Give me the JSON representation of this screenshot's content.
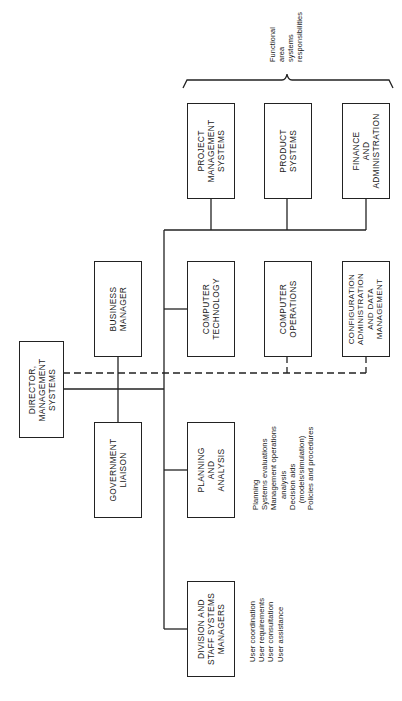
{
  "diagram": {
    "orientation": "rotated -90deg",
    "functional_label": "Functional\narea\nsystems\nresponsibilities",
    "nodes": [
      {
        "id": "director",
        "label": "DIRECTOR,\nMANAGEMENT\nSYSTEMS"
      },
      {
        "id": "business_manager",
        "label": "BUSINESS\nMANAGER"
      },
      {
        "id": "government_liaison",
        "label": "GOVERNMENT\nLIAISON"
      },
      {
        "id": "project_management_systems",
        "label": "PROJECT\nMANAGEMENT\nSYSTEMS"
      },
      {
        "id": "product_systems",
        "label": "PRODUCT\nSYSTEMS"
      },
      {
        "id": "finance_administration",
        "label": "FINANCE\nAND\nADMINISTRATION"
      },
      {
        "id": "computer_technology",
        "label": "COMPUTER\nTECHNOLOGY"
      },
      {
        "id": "computer_operations",
        "label": "COMPUTER\nOPERATIONS"
      },
      {
        "id": "configuration_admin",
        "label": "CONFIGURATION\nADMINISTRATION\nAND DATA\nMANAGEMENT"
      },
      {
        "id": "planning_analysis",
        "label": "PLANNING\nAND\nANALYSIS"
      },
      {
        "id": "division_staff",
        "label": "DIVISION AND\nSTAFF SYSTEMS\nMANAGERS"
      }
    ],
    "notes": {
      "planning_analysis": "Planning\nSystems evaluations\nManagement operations\n     analysis\nDecision aids\n   (models/simulation)\nPolicies and procedures",
      "division_staff": "User coordination\nUser requirements\nUser consultation\nUser assistance"
    },
    "edges": [
      {
        "from": "director",
        "to": "trunk",
        "style": "solid"
      },
      {
        "from": "business_manager",
        "to": "government_liaison",
        "style": "solid"
      },
      {
        "from": "trunk",
        "to": "project_management_systems",
        "style": "solid"
      },
      {
        "from": "trunk",
        "to": "product_systems",
        "style": "solid"
      },
      {
        "from": "trunk",
        "to": "finance_administration",
        "style": "solid"
      },
      {
        "from": "trunk",
        "to": "computer_technology",
        "style": "solid"
      },
      {
        "from": "trunk",
        "to": "planning_analysis",
        "style": "solid"
      },
      {
        "from": "trunk",
        "to": "division_staff",
        "style": "solid"
      },
      {
        "from": "director",
        "to": "computer_operations",
        "style": "dashed"
      },
      {
        "from": "director",
        "to": "configuration_admin",
        "style": "dashed"
      }
    ]
  }
}
